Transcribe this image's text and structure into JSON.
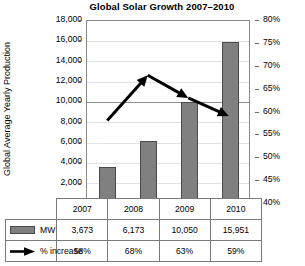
{
  "chart_data": {
    "type": "bar",
    "title": "Global Solar Growth 2007–2010",
    "xlabel": "",
    "ylabel": "Global Average Yearly Production",
    "categories": [
      "2007",
      "2008",
      "2009",
      "2010"
    ],
    "grid": true,
    "legend_position": "table-below",
    "y_axis": {
      "label": "Global Average Yearly Production",
      "min": 0,
      "max": 18000,
      "step": 2000,
      "ticks": [
        "0",
        "2,000",
        "4,000",
        "6,000",
        "8,000",
        "10,000",
        "12,000",
        "14,000",
        "16,000",
        "18,000"
      ]
    },
    "y2_axis": {
      "label": "",
      "min": 40,
      "max": 80,
      "step": 5,
      "ticks": [
        "40%",
        "45%",
        "50%",
        "55%",
        "60%",
        "65%",
        "70%",
        "75%",
        "80%"
      ]
    },
    "series": [
      {
        "name": "MW",
        "type": "bar",
        "axis": "left",
        "color": "#808080",
        "values": [
          3673,
          6173,
          10050,
          15951
        ],
        "labels": [
          "3,673",
          "6,173",
          "10,050",
          "15,951"
        ]
      },
      {
        "name": "% increase",
        "type": "line",
        "axis": "right",
        "color": "#000000",
        "values": [
          58,
          68,
          63,
          59
        ],
        "labels": [
          "58%",
          "68%",
          "63%",
          "59%"
        ]
      }
    ]
  },
  "table": {
    "year_header": [
      "2007",
      "2008",
      "2009",
      "2010"
    ],
    "rows": [
      {
        "legend_label": "MW",
        "legend_icon": "gray-bar-swatch-icon",
        "values": [
          "3,673",
          "6,173",
          "10,050",
          "15,951"
        ]
      },
      {
        "legend_label": "% increase",
        "legend_icon": "black-arrow-swatch-icon",
        "values": [
          "58%",
          "68%",
          "63%",
          "59%"
        ]
      }
    ]
  },
  "colors": {
    "bar_fill": "#808080",
    "bar_stroke": "#4a4a4a",
    "line": "#000000",
    "grid": "#e3e3e3",
    "grid_emphasis": "#8f8f8f",
    "axis": "#8a8a8a",
    "table_border": "#7a7a7a",
    "text": "#000000"
  }
}
